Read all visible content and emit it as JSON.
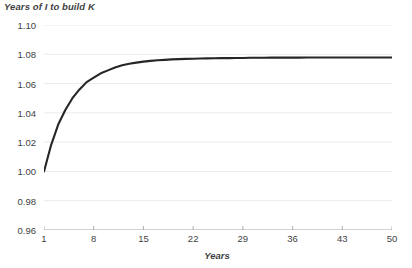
{
  "chart_data": {
    "type": "line",
    "title": "Years of I to build K",
    "xlabel": "Years",
    "ylabel": "",
    "xlim": [
      1,
      50
    ],
    "ylim": [
      0.96,
      1.1
    ],
    "grid": "horizontal",
    "legend": "none",
    "line_color": "#262626",
    "grid_color": "#e8e8e8",
    "axis_color": "#a6a6a6",
    "text_color": "#3f3f3f",
    "y_ticks": [
      "0.96",
      "0.98",
      "1.00",
      "1.02",
      "1.04",
      "1.06",
      "1.08",
      "1.10"
    ],
    "y_tick_values": [
      0.96,
      0.98,
      1.0,
      1.02,
      1.04,
      1.06,
      1.08,
      1.1
    ],
    "x_ticks": [
      "1",
      "8",
      "15",
      "22",
      "29",
      "36",
      "43",
      "50"
    ],
    "x_tick_values": [
      1,
      8,
      15,
      22,
      29,
      36,
      43,
      50
    ],
    "series": [
      {
        "name": "Years of I to build K",
        "x": [
          1,
          2,
          3,
          4,
          5,
          6,
          7,
          8,
          9,
          10,
          11,
          12,
          13,
          14,
          15,
          16,
          17,
          18,
          19,
          20,
          21,
          22,
          23,
          24,
          25,
          26,
          27,
          28,
          29,
          30,
          31,
          32,
          33,
          34,
          35,
          36,
          37,
          38,
          39,
          40,
          41,
          42,
          43,
          44,
          45,
          46,
          47,
          48,
          49,
          50
        ],
        "values": [
          1.0,
          1.018,
          1.032,
          1.042,
          1.05,
          1.056,
          1.061,
          1.064,
          1.067,
          1.069,
          1.071,
          1.0725,
          1.0735,
          1.0743,
          1.075,
          1.0755,
          1.0759,
          1.0762,
          1.0765,
          1.0767,
          1.0769,
          1.077,
          1.0771,
          1.0772,
          1.0773,
          1.0774,
          1.0774,
          1.0775,
          1.0775,
          1.0776,
          1.0776,
          1.0776,
          1.0777,
          1.0777,
          1.0777,
          1.0777,
          1.0777,
          1.0778,
          1.0778,
          1.0778,
          1.0778,
          1.0778,
          1.0778,
          1.0778,
          1.0778,
          1.0778,
          1.0778,
          1.0778,
          1.0778,
          1.0778
        ]
      }
    ]
  }
}
